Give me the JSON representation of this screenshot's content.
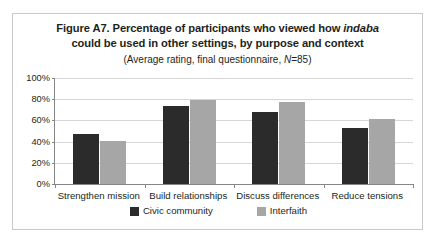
{
  "chart_data": {
    "type": "bar",
    "title_line1_pre": "Figure A7. Percentage of participants who viewed how ",
    "title_line1_italic": "indaba",
    "title_line2": "could be used in other settings, by purpose and context",
    "subtitle_pre": "(Average rating, final questionnaire, ",
    "subtitle_italic": "N",
    "subtitle_post": "=85)",
    "title": "Figure A7. Percentage of participants who viewed how indaba could be used in other settings, by purpose and context",
    "subtitle": "(Average rating, final questionnaire, N=85)",
    "xlabel": "",
    "ylabel": "",
    "ylim": [
      0,
      100
    ],
    "ytick_labels": [
      "100%",
      "80%",
      "60%",
      "40%",
      "20%",
      "0%"
    ],
    "ytick_values": [
      100,
      80,
      60,
      40,
      20,
      0
    ],
    "grid": true,
    "legend_position": "bottom",
    "categories": [
      "Strengthen mission",
      "Build relationships",
      "Discuss differences",
      "Reduce tensions"
    ],
    "series": [
      {
        "name": "Civic community",
        "color": "#2b2b2b",
        "values": [
          47,
          74,
          68,
          53
        ]
      },
      {
        "name": "Interfaith",
        "color": "#a6a6a6",
        "values": [
          41,
          79,
          77,
          61
        ]
      }
    ]
  }
}
